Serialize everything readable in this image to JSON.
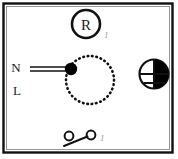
{
  "diagram": {
    "frame": {
      "border_color": "#111111",
      "inner_border_color": "#777777",
      "background": "#ffffff"
    },
    "terminals": [
      {
        "id": "n",
        "label": "N",
        "x": 16,
        "y": 72
      },
      {
        "id": "l",
        "label": "L",
        "x": 17,
        "y": 95
      }
    ],
    "components": [
      {
        "id": "resistor-node",
        "type": "circled-letter",
        "label": "R",
        "cx": 86,
        "cy": 24,
        "r": 14,
        "stroke": "#111111",
        "stroke_width": 2.6
      },
      {
        "id": "rotation-path",
        "type": "dotted-circle",
        "cx": 90,
        "cy": 80,
        "r": 24,
        "dot_color": "#111111",
        "dot_count": 34,
        "dot_radius": 1.3
      },
      {
        "id": "connection-node",
        "type": "filled-node",
        "cx": 71,
        "cy": 69,
        "r": 6.2,
        "fill": "#000000"
      },
      {
        "id": "supply-line",
        "type": "twin-wire",
        "x1": 30,
        "x2": 71,
        "y_top": 67,
        "y_bottom": 71,
        "stroke": "#111111",
        "stroke_width": 1.3
      },
      {
        "id": "shaded-indicator",
        "type": "half-filled-circle",
        "cx": 154,
        "cy": 74,
        "r": 14.5,
        "fill_side": "right",
        "fill": "#000000",
        "stroke": "#111111",
        "stroke_width": 2.2,
        "divider_lines": 2
      },
      {
        "id": "switch",
        "type": "toggle-switch",
        "left_cx": 69,
        "left_cy": 136,
        "right_cx": 91,
        "right_cy": 135,
        "contact_r": 4.4,
        "lever_x1": 64,
        "lever_y1": 146,
        "lever_x2": 88,
        "lever_y2": 137,
        "stroke": "#111111",
        "stroke_width": 2.0
      }
    ],
    "callouts": [
      {
        "id": "callout-resistor",
        "label": "1",
        "x": 104,
        "y": 38
      },
      {
        "id": "callout-switch",
        "label": "1",
        "x": 100,
        "y": 141
      }
    ]
  }
}
